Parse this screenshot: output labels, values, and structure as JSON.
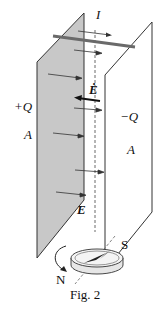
{
  "figure": {
    "caption": "Fig. 2",
    "labels": {
      "current": "I",
      "plate_left_charge": "+Q",
      "plate_right_charge": "−Q",
      "plate_left_area": "A",
      "plate_right_area": "A",
      "field_rate": "Ė",
      "field": "E",
      "compass_north": "N",
      "compass_south": "S"
    },
    "elements": [
      "charged plate (+Q, area A, shaded)",
      "charged plate (−Q, area A, unshaded)",
      "wire carrying current I across top",
      "electric field arrows E between plates",
      "dE/dt arrow pointing left",
      "dashed vertical axis",
      "compass below with rotation arrow"
    ],
    "colors": {
      "left_plate_fill": "#c8c8c8",
      "wire": "#707070",
      "lines": "#222222"
    }
  }
}
